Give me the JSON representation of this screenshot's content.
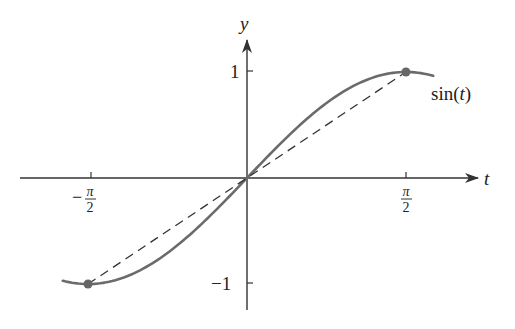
{
  "chart_data": {
    "type": "line",
    "title": "",
    "xlabel": "t",
    "ylabel": "y",
    "xlim": [
      -1.82,
      1.84
    ],
    "ylim": [
      -1.3,
      1.3
    ],
    "grid": false,
    "legend": "none",
    "x_ticks": [
      {
        "value": -1.5708,
        "label": "−π/2",
        "sign": "−",
        "num": "π",
        "den": "2"
      },
      {
        "value": 1.5708,
        "label": "π/2",
        "sign": "",
        "num": "π",
        "den": "2"
      }
    ],
    "y_ticks": [
      {
        "value": 1,
        "label": "1"
      },
      {
        "value": -1,
        "label": "−1"
      }
    ],
    "series": [
      {
        "name": "sin(t)",
        "style": "solid",
        "color": "#6b6b6b",
        "function": "sin(t)",
        "t_range": [
          -1.82,
          1.84
        ],
        "label": "sin(t)",
        "label_position": {
          "t": 1.95,
          "y": 0.82
        }
      },
      {
        "name": "secant",
        "style": "dashed",
        "color": "#333333",
        "x": [
          -1.5708,
          1.5708
        ],
        "values": [
          -1,
          1
        ]
      }
    ],
    "points": [
      {
        "t": -1.5708,
        "y": -1,
        "color": "#666666"
      },
      {
        "t": 1.5708,
        "y": 1,
        "color": "#666666"
      }
    ],
    "annotations": [
      {
        "text": "sin(t)",
        "near": "curve end, upper right"
      }
    ]
  },
  "labels": {
    "x_axis": "t",
    "y_axis": "y",
    "curve_label_prefix": "sin(",
    "curve_label_var": "t",
    "curve_label_suffix": ")",
    "y_tick_pos": "1",
    "y_tick_neg": "−1",
    "x_tick_neg_sign": "−",
    "x_tick_num": "π",
    "x_tick_den": "2"
  },
  "colors": {
    "axis": "#333333",
    "curve": "#6b6b6b",
    "dashed": "#333333",
    "point": "#666666"
  }
}
